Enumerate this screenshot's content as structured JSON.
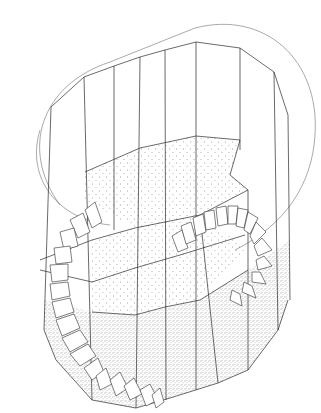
{
  "figure": {
    "kind": "axonometric architectural drawing",
    "colors": {
      "line": "#2a2a2a",
      "background": "#ffffff",
      "stipple": "#3a3a3a"
    },
    "geometry": {
      "outer_ring": "M 60 205 C 20 150 60 80 130 55 L 195 28 C 270 10 330 70 310 140 C 300 190 270 225 225 245",
      "top_polygon": [
        [
          51,
          107
        ],
        [
          84,
          77
        ],
        [
          114,
          66
        ],
        [
          140,
          57
        ],
        [
          165,
          50
        ],
        [
          196,
          42
        ],
        [
          240,
          48
        ],
        [
          274,
          72
        ],
        [
          288,
          115
        ]
      ],
      "mid_polygon": [
        [
          85,
          172
        ],
        [
          140,
          148
        ],
        [
          196,
          136
        ],
        [
          240,
          140
        ],
        [
          230,
          175
        ],
        [
          248,
          190
        ],
        [
          200,
          215
        ],
        [
          135,
          228
        ],
        [
          85,
          200
        ]
      ],
      "bottom_polygon": [
        [
          44,
          330
        ],
        [
          56,
          360
        ],
        [
          92,
          400
        ],
        [
          136,
          408
        ],
        [
          170,
          398
        ],
        [
          218,
          383
        ],
        [
          248,
          370
        ],
        [
          278,
          330
        ],
        [
          288,
          300
        ],
        [
          290,
          270
        ]
      ],
      "verticals_x": [
        51,
        84,
        114,
        140,
        165,
        196,
        240,
        274,
        288
      ]
    }
  }
}
